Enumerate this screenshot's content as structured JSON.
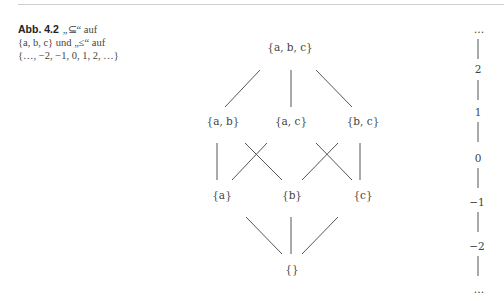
{
  "caption": {
    "label": "Abb. 4.2",
    "line1": "„⊆“ auf",
    "line2": "{a, b, c} und „≤“ auf",
    "line3": "{…, −2, −1, 0, 1, 2, …}"
  },
  "hasse_subsets": {
    "nodes": {
      "abc": "{a, b, c}",
      "ab": "{a, b}",
      "ac": "{a, c}",
      "bc": "{b, c}",
      "a": "{a}",
      "b": "{b}",
      "c": "{c}",
      "empty": "{}"
    }
  },
  "integer_chain": {
    "top": "…",
    "values": [
      "2",
      "1",
      "0",
      "−1",
      "−2"
    ],
    "bottom": "…"
  }
}
